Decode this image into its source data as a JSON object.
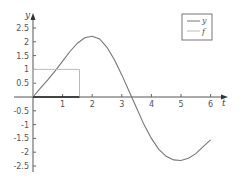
{
  "chart_data": {
    "type": "line",
    "title": "",
    "xlabel": "t",
    "ylabel": "y",
    "xlim": [
      0,
      6.3
    ],
    "ylim": [
      -2.75,
      2.9
    ],
    "xticks": [
      1,
      2,
      3,
      4,
      5,
      6
    ],
    "xtick_labels": [
      "1",
      "2",
      "3",
      "4",
      "5",
      "6"
    ],
    "yticks": [
      2.5,
      2,
      1.5,
      1,
      0.5,
      -0.5,
      -1,
      -1.5,
      -2,
      -2.5
    ],
    "ytick_labels": [
      "2.5",
      "2",
      "1.5",
      "1",
      "0.5",
      "-0.5",
      "-1",
      "-1.5",
      "-2",
      "-2.5"
    ],
    "grid": false,
    "legend_position": "upper right",
    "series": [
      {
        "name": "y",
        "color": "#777777",
        "x": [
          0,
          0.25,
          0.5,
          0.75,
          1.0,
          1.25,
          1.5,
          1.75,
          2.0,
          2.25,
          2.5,
          2.75,
          3.0,
          3.25,
          3.5,
          3.75,
          4.0,
          4.25,
          4.5,
          4.75,
          5.0,
          5.25,
          5.5,
          5.75,
          6.0
        ],
        "values": [
          0,
          0.32,
          0.62,
          0.95,
          1.3,
          1.65,
          1.95,
          2.15,
          2.2,
          2.1,
          1.8,
          1.35,
          0.8,
          0.2,
          -0.4,
          -1.0,
          -1.5,
          -1.9,
          -2.15,
          -2.28,
          -2.3,
          -2.22,
          -2.05,
          -1.8,
          -1.55
        ]
      },
      {
        "name": "f",
        "color": "#bbbbbb",
        "x": [
          0,
          0,
          1.5708,
          1.5708
        ],
        "values": [
          0,
          1,
          1,
          0
        ]
      }
    ],
    "legend": [
      "y",
      "f"
    ]
  }
}
